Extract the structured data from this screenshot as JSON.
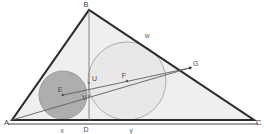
{
  "figure": {
    "canvas": {
      "width": 264,
      "height": 134
    },
    "colors": {
      "triangle_fill": "#efefef",
      "triangle_stroke": "#2b2b2b",
      "small_circle_fill": "#a8a8a8",
      "small_circle_stroke": "#8c8c8c",
      "large_circle_fill": "#e3e3e3",
      "large_circle_stroke": "#9a9a9a",
      "line_stroke": "#6e6e6e",
      "baseline_stroke": "#4a4a4a",
      "label_color": "#3b3b3b",
      "point_color": "#555555"
    }
  },
  "vertices": [
    {
      "id": "A",
      "label": "A",
      "x": 12,
      "y": 120,
      "label_x": 4,
      "label_y": 124
    },
    {
      "id": "B",
      "label": "B",
      "x": 89,
      "y": 10,
      "label_x": 86,
      "label_y": 7
    },
    {
      "id": "C",
      "label": "C",
      "x": 254,
      "y": 120,
      "label_x": 255,
      "label_y": 124
    }
  ],
  "points": [
    {
      "id": "D",
      "label": "D",
      "x": 89,
      "y": 120,
      "label_x": 86,
      "label_y": 131
    },
    {
      "id": "E",
      "label": "E",
      "x": 63,
      "y": 95,
      "label_x": 59,
      "label_y": 91
    },
    {
      "id": "F",
      "label": "F",
      "x": 127,
      "y": 81,
      "label_x": 123,
      "label_y": 77
    },
    {
      "id": "G",
      "label": "G",
      "x": 190,
      "y": 68,
      "label_x": 192,
      "label_y": 65
    },
    {
      "id": "U",
      "label": "U",
      "x": 89,
      "y": 83,
      "label_x": 91,
      "label_y": 80
    },
    {
      "id": "V",
      "label": "V",
      "x": 89,
      "y": 96,
      "label_x": 81,
      "label_y": 99
    }
  ],
  "segment_labels": [
    {
      "id": "w",
      "label": "w",
      "x": 147,
      "y": 36
    },
    {
      "id": "x",
      "label": "x",
      "x": 62,
      "y": 131
    },
    {
      "id": "y",
      "label": "y",
      "x": 131,
      "y": 132
    }
  ],
  "circles": [
    {
      "id": "small-circle",
      "name": "incircle-of-ABD",
      "center_label": "E",
      "cx": 63,
      "cy": 95,
      "r": 24
    },
    {
      "id": "large-circle",
      "name": "incircle-of-BDC",
      "center_label": "F",
      "cx": 127,
      "cy": 81,
      "r": 39
    }
  ],
  "lines": [
    {
      "id": "altitude-BD",
      "name": "altitude-b-to-d",
      "x1": 89,
      "y1": 10,
      "x2": 89,
      "y2": 120
    },
    {
      "id": "line-EFG",
      "name": "center-line-e-f-g",
      "x1": 63,
      "y1": 95,
      "x2": 190,
      "y2": 68
    },
    {
      "id": "line-AG",
      "name": "line-a-to-g",
      "x1": 12,
      "y1": 120,
      "x2": 190,
      "y2": 68
    },
    {
      "id": "baseline-AC",
      "name": "baseline-a-to-c",
      "x1": 8,
      "y1": 124,
      "x2": 258,
      "y2": 124
    }
  ]
}
